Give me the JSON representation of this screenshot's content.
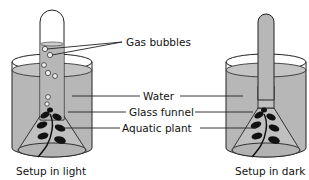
{
  "diagram": {
    "labels": {
      "gas_bubbles": "Gas bubbles",
      "water": "Water",
      "glass_funnel": "Glass funnel",
      "aquatic_plant": "Aquatic plant"
    },
    "captions": {
      "light": "Setup in light",
      "dark": "Setup in dark"
    },
    "colors": {
      "water": "#b7b7b7",
      "gas": "#e6e6e6",
      "outline": "#222222",
      "plant": "#111111"
    }
  }
}
